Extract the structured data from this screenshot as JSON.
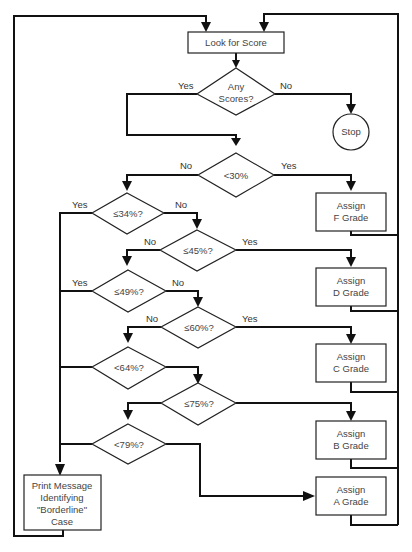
{
  "diagram": {
    "nodes": {
      "start": {
        "type": "process",
        "text": "Look for Score"
      },
      "any_scores": {
        "type": "decision",
        "line1": "Any",
        "line2": "Scores?"
      },
      "stop": {
        "type": "terminal",
        "text": "Stop"
      },
      "lt30": {
        "type": "decision",
        "text": "<30%"
      },
      "assign_f": {
        "type": "process",
        "line1": "Assign",
        "line2": "F Grade"
      },
      "le34": {
        "type": "decision",
        "text": "≤34%?"
      },
      "le45": {
        "type": "decision",
        "text": "≤45%?"
      },
      "assign_d": {
        "type": "process",
        "line1": "Assign",
        "line2": "D Grade"
      },
      "le49": {
        "type": "decision",
        "text": "≤49%?"
      },
      "le60": {
        "type": "decision",
        "text": "≤60%?"
      },
      "assign_c": {
        "type": "process",
        "line1": "Assign",
        "line2": "C Grade"
      },
      "le64": {
        "type": "decision",
        "text": "<64%?"
      },
      "le75": {
        "type": "decision",
        "text": "≤75%?"
      },
      "assign_b": {
        "type": "process",
        "line1": "Assign",
        "line2": "B Grade"
      },
      "le79": {
        "type": "decision",
        "text": "<79%?"
      },
      "borderline": {
        "type": "process",
        "line1": "Print Message",
        "line2": "Identifying",
        "line3": "\"Borderline\"",
        "line4": "Case"
      },
      "assign_a": {
        "type": "process",
        "line1": "Assign",
        "line2": "A Grade"
      }
    },
    "edge_labels": {
      "any_yes": "Yes",
      "any_no": "No",
      "lt30_no": "No",
      "lt30_yes": "Yes",
      "le34_yes": "Yes",
      "le34_no": "No",
      "le45_no": "No",
      "le45_yes": "Yes",
      "le49_yes": "Yes",
      "le49_no": "No",
      "le60_no": "No",
      "le60_yes": "Yes"
    },
    "edges": [
      {
        "from": "start",
        "to": "any_scores"
      },
      {
        "from": "any_scores",
        "to": "lt30",
        "label": "Yes"
      },
      {
        "from": "any_scores",
        "to": "stop",
        "label": "No"
      },
      {
        "from": "lt30",
        "to": "assign_f",
        "label": "Yes"
      },
      {
        "from": "lt30",
        "to": "le34",
        "label": "No"
      },
      {
        "from": "le34",
        "to": "borderline",
        "label": "Yes"
      },
      {
        "from": "le34",
        "to": "le45",
        "label": "No"
      },
      {
        "from": "le45",
        "to": "assign_d",
        "label": "Yes"
      },
      {
        "from": "le45",
        "to": "le49",
        "label": "No"
      },
      {
        "from": "le49",
        "to": "borderline",
        "label": "Yes"
      },
      {
        "from": "le49",
        "to": "le60",
        "label": "No"
      },
      {
        "from": "le60",
        "to": "assign_c",
        "label": "Yes"
      },
      {
        "from": "le60",
        "to": "le64",
        "label": "No"
      },
      {
        "from": "le64",
        "to": "borderline"
      },
      {
        "from": "le64",
        "to": "le75"
      },
      {
        "from": "le75",
        "to": "assign_b"
      },
      {
        "from": "le75",
        "to": "le79"
      },
      {
        "from": "le79",
        "to": "borderline"
      },
      {
        "from": "le79",
        "to": "assign_a"
      },
      {
        "from": "borderline",
        "to": "start"
      },
      {
        "from": "assign_f",
        "to": "start"
      },
      {
        "from": "assign_d",
        "to": "start"
      },
      {
        "from": "assign_c",
        "to": "start"
      },
      {
        "from": "assign_b",
        "to": "start"
      },
      {
        "from": "assign_a",
        "to": "start"
      }
    ]
  }
}
